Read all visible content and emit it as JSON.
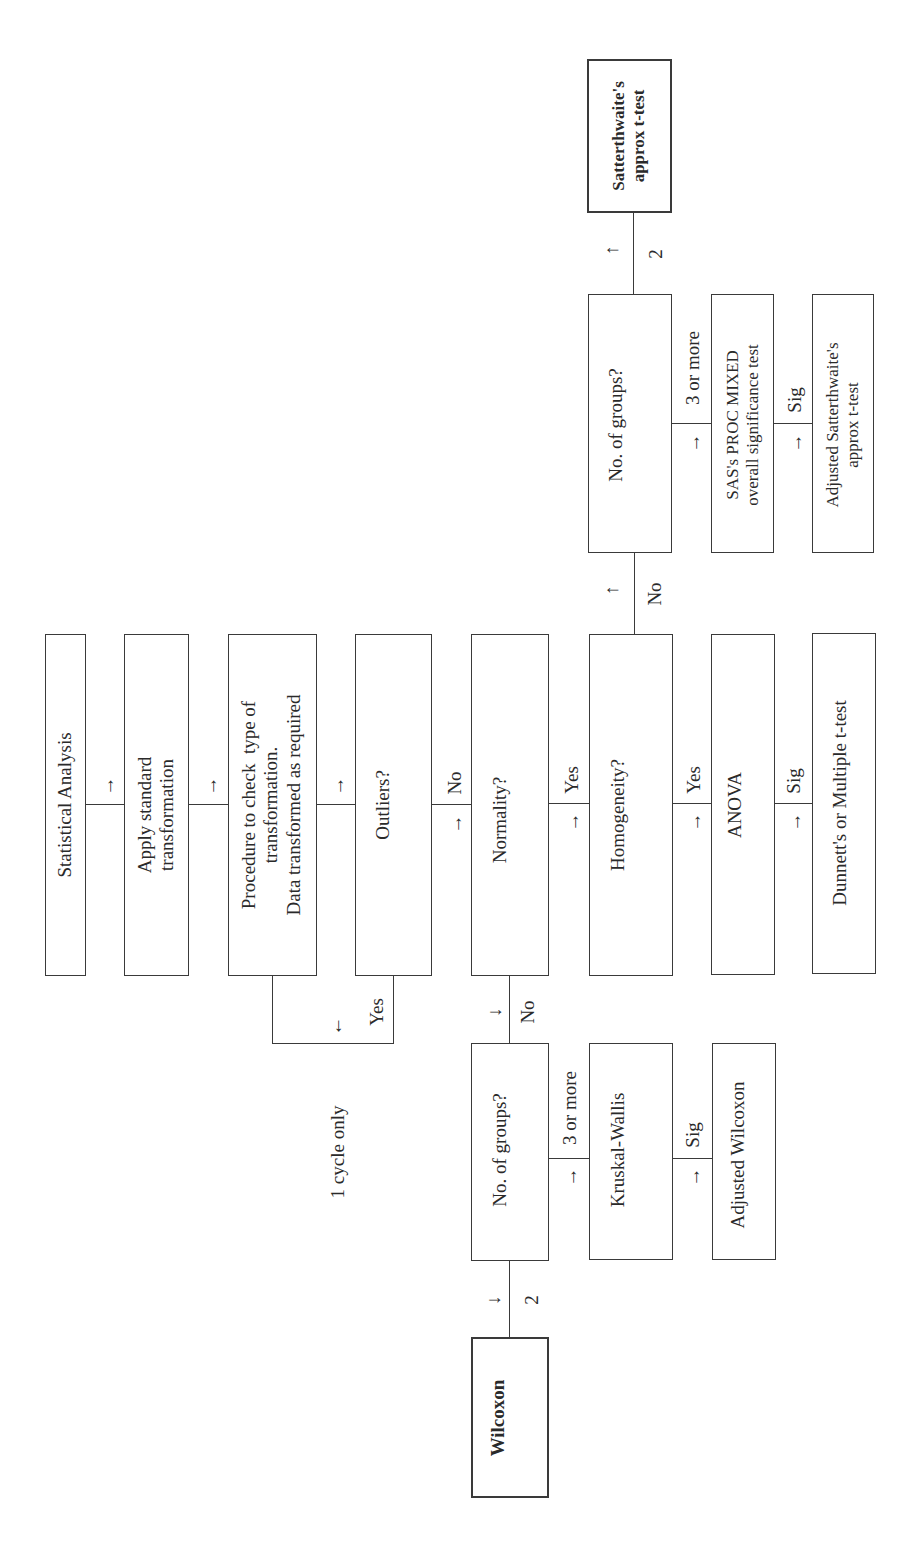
{
  "diagram": {
    "orientation": "rotated-90-ccw",
    "nodes": {
      "statistical_analysis": "Statistical Analysis",
      "apply_standard": "Apply standard\ntransformation",
      "procedure": "Procedure to check  type of\ntransformation.\nData transformed as required",
      "outliers": "Outliers?",
      "normality": "Normality?",
      "homogeneity": "Homogeneity?",
      "anova": "ANOVA",
      "dunnetts": "Dunnett's or Multiple t-test",
      "groups_param": "No. of groups?",
      "sas_mixed": "SAS's PROC MIXED\noverall significance test",
      "adj_satterthwaite": "Adjusted Satterthwaite's\napprox t-test",
      "satterthwaite": "Satterthwaite's\napprox t-test",
      "groups_nonparam": "No. of groups?",
      "kruskal_wallis": "Kruskal-Wallis",
      "adj_wilcoxon": "Adjusted Wilcoxon",
      "wilcoxon": "Wilcoxon"
    },
    "edge_labels": {
      "outliers_no": "No",
      "outliers_yes": "Yes",
      "normality_yes": "Yes",
      "normality_no": "No",
      "homogeneity_yes": "Yes",
      "homogeneity_no": "No",
      "anova_sig": "Sig",
      "param_three_or_more": "3 or more",
      "param_two": "2",
      "sas_sig": "Sig",
      "nonparam_three_or_more": "3 or more",
      "nonparam_two": "2",
      "kruskal_sig": "Sig"
    },
    "annotations": {
      "cycle_note": "1 cycle only"
    },
    "arrows": {
      "right": "→",
      "left": "←",
      "up": "↑",
      "down": "↓"
    }
  }
}
